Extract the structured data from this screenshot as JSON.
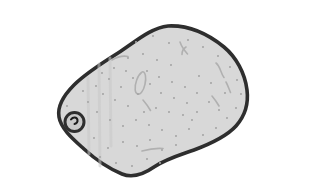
{
  "illustration": {
    "subject": "potato",
    "style": "hand-drawn grayscale clipart",
    "alt_text": "Grayscale drawing of a speckled potato with one eye on its left side"
  },
  "canvas": {
    "width": 221,
    "height": 174,
    "background": "#ffffff"
  },
  "potato": {
    "fill": "#d8d8d8",
    "outline_color": "#2e2e2e",
    "outline_width": 3.6,
    "body_path": "M128,10 C148,9 168,18 184,31 C196,41 205,57 207,74 C209,90 204,101 196,110 C186,121 170,128 154,134 C140,139 126,143 114,151 C104,158 92,162 82,158 C70,153 56,144 44,133 C33,123 21,113 19,101 C17,90 24,79 34,69 C46,57 62,47 78,37 C94,27 110,12 128,10 Z",
    "shading": {
      "color": "#c9c9c9",
      "width": 3,
      "streaks": [
        {
          "x1": 59,
          "y1": 48,
          "x2": 60,
          "y2": 150
        },
        {
          "x1": 48,
          "y1": 62,
          "x2": 49,
          "y2": 138
        },
        {
          "x1": 70,
          "y1": 42,
          "x2": 71,
          "y2": 130
        }
      ]
    },
    "eye": {
      "cx": 34.5,
      "cy": 106,
      "outer_r": 9.5,
      "ring_color": "#2e2e2e",
      "ring_width": 3,
      "inner_fill": "#c9c9c9",
      "mark_path": "M31,103.5 c2,-3 6,-2.5 6.5,0.5 c0.3,2 -1,3.5 -3,4",
      "mark_color": "#1c1c1c",
      "mark_width": 2
    },
    "texture_marks": {
      "color": "#b0b0b0",
      "width": 1.6,
      "paths": [
        "M101.5,56.5 c-3.5,2.5 -7,11 -6.3,17.5 c0.5,4.5 3.6,5.6 6.2,2.6 c3.2,-3.8 5,-12.4 4,-17.2 c-0.7,-3.3 -2.2,-4.6 -3.9,-2.9",
        "M103,84 c3,3.5 5.5,7 7.5,10.5",
        "M72,44 c5,-3 11,-4.5 16,-3.5",
        "M140,26 c1.5,4.5 4,8 7.5,12",
        "M146,31 c-2.5,1.5 -4,4.5 -4,7.5",
        "M176,47 c4.5,3.5 4.5,10 8,14.5",
        "M186,66 c2,3.5 3,7 4.5,10.5",
        "M172,80 c2.5,3 5,6.5 7,10",
        "M102,135 c7,-2 15,-3 21,-2.5"
      ]
    },
    "speckles": {
      "color": "#a5a5a5",
      "radius": 1.05,
      "points": [
        [
          96,
          26
        ],
        [
          113,
          20
        ],
        [
          129,
          27
        ],
        [
          148,
          24
        ],
        [
          163,
          31
        ],
        [
          178,
          40
        ],
        [
          190,
          51
        ],
        [
          197,
          64
        ],
        [
          201,
          78
        ],
        [
          196,
          92
        ],
        [
          187,
          102
        ],
        [
          176,
          112
        ],
        [
          163,
          119
        ],
        [
          149,
          113
        ],
        [
          136,
          120
        ],
        [
          122,
          114
        ],
        [
          109,
          109
        ],
        [
          96,
          104
        ],
        [
          83,
          110
        ],
        [
          70,
          104
        ],
        [
          57,
          96
        ],
        [
          48,
          86
        ],
        [
          43,
          75
        ],
        [
          56,
          70
        ],
        [
          69,
          63
        ],
        [
          81,
          71
        ],
        [
          93,
          62
        ],
        [
          107,
          55
        ],
        [
          119,
          61
        ],
        [
          132,
          66
        ],
        [
          145,
          71
        ],
        [
          157,
          77
        ],
        [
          169,
          86
        ],
        [
          179,
          94
        ],
        [
          157,
          96
        ],
        [
          143,
          99
        ],
        [
          129,
          96
        ],
        [
          116,
          92
        ],
        [
          104,
          96
        ],
        [
          88,
          90
        ],
        [
          75,
          84
        ],
        [
          63,
          78
        ],
        [
          110,
          124
        ],
        [
          97,
          130
        ],
        [
          83,
          126
        ],
        [
          68,
          132
        ],
        [
          54,
          122
        ],
        [
          41,
          110
        ],
        [
          27,
          90
        ],
        [
          122,
          134
        ],
        [
          136,
          129
        ],
        [
          152,
          104
        ],
        [
          60,
          141
        ],
        [
          76,
          147
        ],
        [
          92,
          150
        ],
        [
          107,
          143
        ],
        [
          120,
          147
        ],
        [
          88,
          42
        ],
        [
          74,
          52
        ],
        [
          62,
          57
        ],
        [
          103,
          38
        ],
        [
          117,
          44
        ],
        [
          131,
          49
        ],
        [
          86,
          55
        ],
        [
          98,
          78
        ],
        [
          121,
          77
        ],
        [
          134,
          82
        ],
        [
          147,
          87
        ],
        [
          110,
          68
        ],
        [
          159,
          60
        ],
        [
          171,
          67
        ],
        [
          185,
          77
        ]
      ]
    }
  }
}
